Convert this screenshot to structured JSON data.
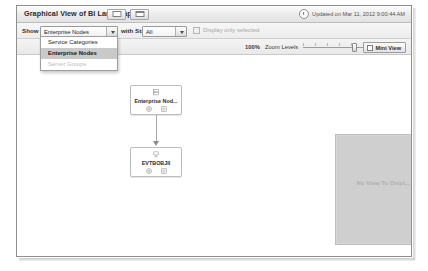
{
  "window": {
    "title": "Graphical View of BI Landscape",
    "title_buttons": [
      {
        "name": "restore-button",
        "glyph": "restore"
      },
      {
        "name": "maximize-button",
        "glyph": "maximize"
      }
    ],
    "updated_text": "Updated on Mar 11, 2012 9:00:44 AM",
    "clock_icon": "clock-icon"
  },
  "toolbar": {
    "show_label": "Show",
    "show_combo": {
      "value": "Enterprise Nodes",
      "options": [
        "Service Categories",
        "Enterprise Nodes",
        "Server Groups"
      ]
    },
    "with_state_label": "with State",
    "state_combo": {
      "value": "All",
      "options": [
        "All"
      ]
    },
    "display_only_selected": {
      "label": "Display only selected",
      "checked": false,
      "enabled": false
    }
  },
  "zoom_bar": {
    "percent": "100%",
    "label": "Zoom Levels",
    "slider_value": 68,
    "mini_view_button": {
      "label": "Mini View",
      "icon": "mini-view-icon"
    }
  },
  "dropdown": {
    "open": true,
    "items": [
      {
        "label": "Service Categories",
        "state": "normal"
      },
      {
        "label": "Enterprise Nodes",
        "state": "selected"
      },
      {
        "label": "Server Groups",
        "state": "disabled"
      }
    ]
  },
  "graph": {
    "nodes": [
      {
        "id": "enterprise-node",
        "label": "Enterprise Nod...",
        "icon": "server-node-icon",
        "actions": [
          "expand-icon",
          "details-icon"
        ]
      },
      {
        "id": "evtbobj-node",
        "label": "EVTBOBJII",
        "icon": "host-node-icon",
        "actions": [
          "expand-icon",
          "details-icon"
        ]
      }
    ],
    "edges": [
      {
        "from": "enterprise-node",
        "to": "evtbobj-node",
        "arrow": "down"
      }
    ]
  },
  "mini_view": {
    "message": "No View To Displ...",
    "resize_grip": "resize-grip-icon"
  },
  "colors": {
    "window_border": "#8e8e8e",
    "titlebar_top": "#fdfdfd",
    "titlebar_bottom": "#e2e2e2",
    "toolbar_bg": "#f0f0f0",
    "selected_item": "#c9c9c9",
    "mini_panel": "#cfcfcf",
    "node_border": "#bcbcbc",
    "edge": "#a8a8a8"
  }
}
